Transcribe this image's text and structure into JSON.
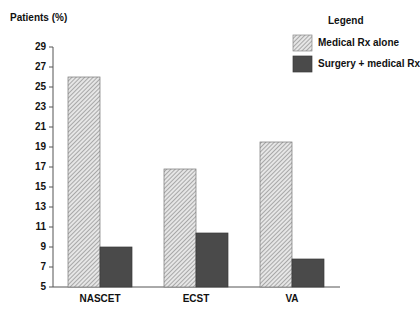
{
  "chart_data": {
    "type": "bar",
    "title": "",
    "xlabel": "",
    "ylabel": "Patients (%)",
    "ylim": [
      5,
      29
    ],
    "yticks": [
      5,
      7,
      9,
      11,
      13,
      15,
      17,
      19,
      21,
      23,
      25,
      27,
      29
    ],
    "grid": false,
    "legend_title": "Legend",
    "legend_position": "top-right",
    "categories": [
      "NASCET",
      "ECST",
      "VA"
    ],
    "series": [
      {
        "name": "Medical Rx alone",
        "values": [
          26,
          16.8,
          19.5
        ],
        "fill": "hatched-light",
        "color": "#cfcfcf"
      },
      {
        "name": "Surgery + medical Rx",
        "values": [
          9,
          10.4,
          7.8
        ],
        "fill": "solid-dark",
        "color": "#4a4a4a"
      }
    ]
  }
}
